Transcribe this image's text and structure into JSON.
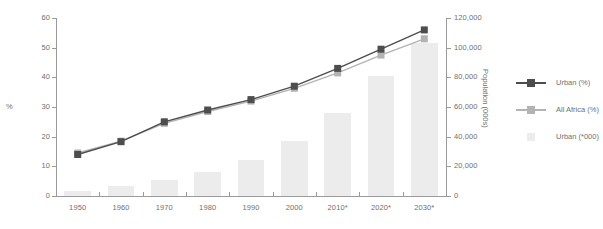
{
  "chart_data": {
    "type": "bar",
    "title": "",
    "xlabel": "",
    "ylabel": "%",
    "ylabel_right": "Population (000s)",
    "grid": false,
    "legend_position": "right",
    "categories": [
      "1950",
      "1960",
      "1970",
      "1980",
      "1990",
      "2000",
      "2010*",
      "2020*",
      "2030*"
    ],
    "ylim": [
      0,
      60
    ],
    "ylim_right": [
      0,
      120000
    ],
    "yticks": [
      "0",
      "10",
      "20",
      "30",
      "40",
      "50",
      "60"
    ],
    "ytick_values": [
      0,
      10,
      20,
      30,
      40,
      50,
      60
    ],
    "yticks_right": [
      "0",
      "20,000",
      "40,000",
      "60,000",
      "80,000",
      "100,000",
      "120,000"
    ],
    "ytick_values_right": [
      0,
      20000,
      40000,
      60000,
      80000,
      100000,
      120000
    ],
    "series": [
      {
        "name": "Urban (%)",
        "type": "line",
        "axis": "left",
        "color": "#4d4d4d",
        "marker": "square",
        "values": [
          14,
          18.3,
          25,
          29,
          32.5,
          37,
          43,
          49.5,
          56
        ]
      },
      {
        "name": "All Africa (%)",
        "type": "line",
        "axis": "left",
        "color": "#b3b3b3",
        "marker": "square",
        "values": [
          14.5,
          18.5,
          24.5,
          28.5,
          32,
          36.3,
          41.5,
          47.5,
          53
        ]
      },
      {
        "name": "Urban ('000)",
        "type": "bar",
        "axis": "right",
        "color": "#ececec",
        "values": [
          3500,
          6500,
          11000,
          16500,
          24000,
          37000,
          56000,
          81000,
          103000
        ]
      }
    ]
  },
  "legend": {
    "items": [
      {
        "label": "Urban (%)",
        "swatch": "line-marker-dark",
        "color": "#4d4d4d"
      },
      {
        "label": "All Africa (%)",
        "swatch": "line-marker-light",
        "color": "#b3b3b3"
      },
      {
        "label": "Urban (*000)",
        "swatch": "bar-swatch",
        "color": "#ececec"
      }
    ]
  },
  "colors": {
    "urban_pct": "#4d4d4d",
    "all_africa_pct": "#b3b3b3",
    "urban_000": "#ececec",
    "axis": "#9a9a9a",
    "text": "#6f6f6f",
    "background": "#ffffff"
  }
}
